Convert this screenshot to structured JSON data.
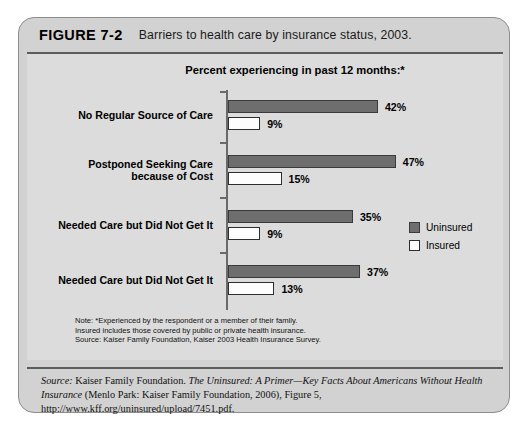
{
  "figure": {
    "number": "FIGURE 7-2",
    "caption": "Barriers to health care by insurance status, 2003."
  },
  "notes": [
    "Note:  *Experienced by the respondent or a member of their family.",
    "Insured includes those covered by public or private health insurance.",
    "Source: Kaiser Family Foundation, Kaiser 2003 Health Insurance Survey."
  ],
  "source": {
    "label": "Source:",
    "publisher": " Kaiser Family Foundation. ",
    "title": "The Uninsured: A Primer—Key Facts About Americans Without Health Insurance",
    "rest": " (Menlo Park: Kaiser Family Foundation, 2006), Figure 5, http://www.kff.org/uninsured/upload/7451.pdf."
  },
  "chart_data": {
    "type": "bar",
    "orientation": "horizontal",
    "title": "Percent experiencing in past 12 months:*",
    "xlabel": "",
    "ylabel": "",
    "xlim": [
      0,
      47
    ],
    "grid": false,
    "legend_position": "right",
    "categories": [
      "No Regular Source of Care",
      "Postponed Seeking Care\nbecause of Cost",
      "Needed Care but Did Not Get It",
      "Needed Care but Did Not Get It"
    ],
    "category_lines": [
      [
        "No Regular Source of Care"
      ],
      [
        "Postponed Seeking Care",
        "because of Cost"
      ],
      [
        "Needed Care but Did Not Get It"
      ],
      [
        "Needed Care but Did Not Get It"
      ]
    ],
    "series": [
      {
        "name": "Uninsured",
        "color": "#6e6e6e",
        "values": [
          42,
          47,
          35,
          37
        ],
        "labels": [
          "42%",
          "47%",
          "35%",
          "37%"
        ]
      },
      {
        "name": "Insured",
        "color": "#ffffff",
        "values": [
          9,
          15,
          9,
          13
        ],
        "labels": [
          "9%",
          "15%",
          "9%",
          "13%"
        ]
      }
    ]
  }
}
